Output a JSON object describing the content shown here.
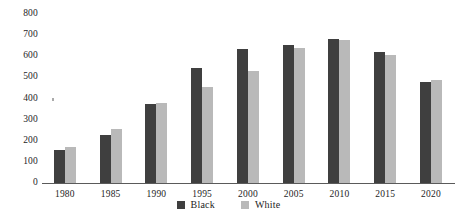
{
  "chart_data": {
    "type": "bar",
    "title": "",
    "xlabel": "",
    "ylabel": "",
    "ylim": [
      0,
      800
    ],
    "yticks": [
      800,
      700,
      600,
      500,
      400,
      300,
      200,
      100,
      0
    ],
    "grid": false,
    "legend_position": "bottom-center",
    "categories": [
      "1980",
      "1985",
      "1990",
      "1995",
      "2000",
      "2005",
      "2010",
      "2015",
      "2020"
    ],
    "series": [
      {
        "name": "Black",
        "color": "#3f3f3f",
        "values": [
          155,
          225,
          375,
          545,
          635,
          655,
          680,
          620,
          480
        ]
      },
      {
        "name": "White",
        "color": "#b9b9b9",
        "values": [
          170,
          258,
          378,
          455,
          530,
          640,
          675,
          607,
          487
        ]
      }
    ]
  },
  "legend": {
    "items": [
      {
        "label": "Black",
        "color": "#3f3f3f"
      },
      {
        "label": "White",
        "color": "#b9b9b9"
      }
    ]
  }
}
